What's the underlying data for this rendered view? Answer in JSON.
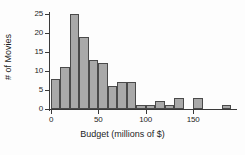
{
  "chart_data": {
    "type": "bar",
    "title": "",
    "xlabel": "Budget (millions of $)",
    "ylabel": "# of Movies",
    "xlim": [
      0,
      190
    ],
    "ylim": [
      0,
      25
    ],
    "grid": false,
    "legend": "none",
    "bin_width": 10,
    "bin_starts": [
      0,
      10,
      20,
      30,
      40,
      50,
      60,
      70,
      80,
      90,
      100,
      110,
      120,
      130,
      140,
      150,
      160,
      170,
      180
    ],
    "categories": [
      "0-10",
      "10-20",
      "20-30",
      "30-40",
      "40-50",
      "50-60",
      "60-70",
      "70-80",
      "80-90",
      "90-100",
      "100-110",
      "110-120",
      "120-130",
      "130-140",
      "140-150",
      "150-160",
      "160-170",
      "170-180",
      "180-190"
    ],
    "values": [
      8,
      11,
      25,
      19,
      13,
      12,
      6,
      7,
      7,
      1,
      1,
      2,
      1,
      3,
      0,
      3,
      0,
      0,
      1
    ],
    "xticks": [
      0,
      50,
      100,
      150
    ],
    "xtick_labels": [
      "0",
      "50",
      "100",
      "150"
    ],
    "yticks": [
      0,
      5,
      10,
      15,
      20,
      25
    ],
    "ytick_labels": [
      "0",
      "5",
      "10",
      "15",
      "20",
      "25"
    ],
    "bar_color": "#a9a9a9",
    "bar_edge_color": "#4a4a4a",
    "axis_color": "#3a3a3a",
    "text_color": "#1d1d1d",
    "background": "#fdfdfd"
  }
}
